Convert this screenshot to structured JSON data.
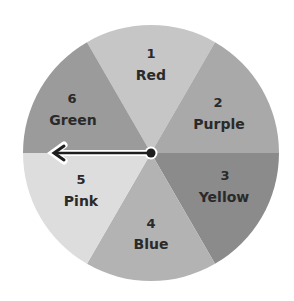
{
  "spinner": {
    "center": [
      151,
      153
    ],
    "radius": 128,
    "sectors": [
      {
        "number": "1",
        "label": "Red",
        "color": "#c6c6c6",
        "start_deg": 60,
        "end_deg": 120
      },
      {
        "number": "2",
        "label": "Purple",
        "color": "#a9a9a9",
        "start_deg": 0,
        "end_deg": 60
      },
      {
        "number": "3",
        "label": "Yellow",
        "color": "#8b8b8b",
        "start_deg": 300,
        "end_deg": 360
      },
      {
        "number": "4",
        "label": "Blue",
        "color": "#b3b3b3",
        "start_deg": 240,
        "end_deg": 300
      },
      {
        "number": "5",
        "label": "Pink",
        "color": "#dddddd",
        "start_deg": 180,
        "end_deg": 240
      },
      {
        "number": "6",
        "label": "Green",
        "color": "#9b9b9b",
        "start_deg": 120,
        "end_deg": 180
      }
    ],
    "arrow": {
      "direction": "left",
      "color": "#1e1e1e",
      "points_to_boundary_between": [
        "5",
        "6"
      ]
    }
  }
}
